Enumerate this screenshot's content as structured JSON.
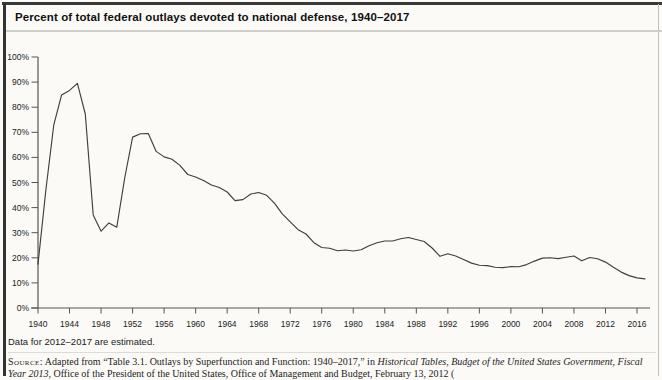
{
  "chart_data": {
    "type": "line",
    "title": "Percent of total federal outlays devoted to national defense, 1940–2017",
    "xlabel": "",
    "ylabel": "",
    "xlim": [
      1940,
      2017
    ],
    "ylim": [
      0,
      100
    ],
    "grid": false,
    "legend": "none",
    "line_color": "#3f3f3f",
    "axis_color": "#555555",
    "tick_label_color": "#222222",
    "xticks": [
      1940,
      1944,
      1948,
      1952,
      1956,
      1960,
      1964,
      1968,
      1972,
      1976,
      1980,
      1984,
      1988,
      1992,
      1996,
      2000,
      2004,
      2008,
      2012,
      2016
    ],
    "ytick_values": [
      0,
      10,
      20,
      30,
      40,
      50,
      60,
      70,
      80,
      90,
      100
    ],
    "ytick_labels": [
      "0%",
      "10%",
      "20%",
      "30%",
      "40%",
      "50%",
      "60%",
      "70%",
      "80%",
      "90%",
      "100%"
    ],
    "x": [
      1940,
      1941,
      1942,
      1943,
      1944,
      1945,
      1946,
      1947,
      1948,
      1949,
      1950,
      1951,
      1952,
      1953,
      1954,
      1955,
      1956,
      1957,
      1958,
      1959,
      1960,
      1961,
      1962,
      1963,
      1964,
      1965,
      1966,
      1967,
      1968,
      1969,
      1970,
      1971,
      1972,
      1973,
      1974,
      1975,
      1976,
      1977,
      1978,
      1979,
      1980,
      1981,
      1982,
      1983,
      1984,
      1985,
      1986,
      1987,
      1988,
      1989,
      1990,
      1991,
      1992,
      1993,
      1994,
      1995,
      1996,
      1997,
      1998,
      1999,
      2000,
      2001,
      2002,
      2003,
      2004,
      2005,
      2006,
      2007,
      2008,
      2009,
      2010,
      2011,
      2012,
      2013,
      2014,
      2015,
      2016,
      2017
    ],
    "values": [
      17.5,
      47.1,
      73.0,
      84.9,
      86.7,
      89.5,
      77.3,
      37.1,
      30.6,
      33.9,
      32.2,
      51.8,
      68.1,
      69.4,
      69.5,
      62.4,
      60.2,
      59.3,
      56.8,
      53.2,
      52.2,
      50.8,
      49.0,
      48.0,
      46.2,
      42.8,
      43.2,
      45.4,
      46.0,
      44.9,
      41.8,
      37.5,
      34.3,
      31.2,
      29.5,
      26.0,
      24.1,
      23.8,
      22.8,
      23.1,
      22.7,
      23.2,
      24.8,
      26.0,
      26.7,
      26.7,
      27.6,
      28.1,
      27.3,
      26.5,
      23.9,
      20.6,
      21.6,
      20.7,
      19.3,
      17.9,
      17.0,
      16.9,
      16.2,
      16.1,
      16.5,
      16.4,
      17.3,
      18.7,
      19.9,
      20.0,
      19.7,
      20.2,
      20.7,
      18.8,
      20.1,
      19.6,
      18.3,
      16.2,
      14.3,
      12.9,
      12.0,
      11.6
    ]
  },
  "footnote": "Data for 2012–2017 are estimated.",
  "source": {
    "label": "Source:",
    "text_roman_1": "Adapted from “Table 3.1. Outlays by Superfunction and Function: 1940–2017,” in ",
    "text_italic": "Historical Tables, Budget of the United States Government, Fiscal Year 2013",
    "text_roman_2": ", Office of the President of the United States, Office of Management and Budget, February 13, 2012 ("
  }
}
